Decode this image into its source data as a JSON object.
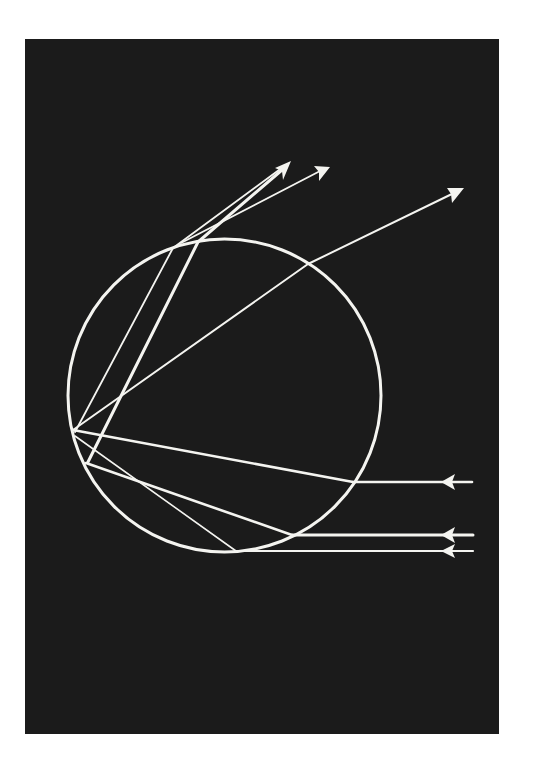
{
  "diagram": {
    "title": "",
    "colors": {
      "page_background": "#ffffff",
      "panel_background": "#1b1b1b",
      "line": "#f4f4f0"
    },
    "panel": {
      "x": 25,
      "y": 39,
      "width": 474,
      "height": 695
    },
    "droplet": {
      "cx": 224.5,
      "cy": 395.5,
      "r": 156.5
    },
    "incoming_rays": [
      {
        "id": "ray-a",
        "y": 482,
        "start_x": 472,
        "entry": [
          353,
          482
        ],
        "arrow_tip": [
          442,
          482
        ]
      },
      {
        "id": "ray-b",
        "y": 535,
        "start_x": 472,
        "entry": [
          292,
          535
        ],
        "arrow_tip": [
          442,
          535
        ]
      },
      {
        "id": "ray-c",
        "y": 551,
        "start_x": 472,
        "entry": [
          236,
          551
        ],
        "arrow_tip": [
          442,
          551
        ]
      }
    ],
    "internal_paths": [
      {
        "id": "ray-a-internal",
        "points": [
          [
            353,
            482
          ],
          [
            73,
            430
          ]
        ]
      },
      {
        "id": "ray-b-internal",
        "points": [
          [
            292,
            535
          ],
          [
            86,
            463
          ]
        ]
      },
      {
        "id": "ray-c-internal",
        "points": [
          [
            236,
            551
          ],
          [
            75,
            436
          ]
        ]
      }
    ],
    "outgoing_rays": [
      {
        "id": "out-1",
        "points": [
          [
            73,
            430
          ],
          [
            308,
            264
          ],
          [
            463,
            189
          ]
        ]
      },
      {
        "id": "out-2",
        "points": [
          [
            75,
            432
          ],
          [
            173,
            248
          ],
          [
            290,
            162
          ]
        ]
      },
      {
        "id": "out-3",
        "points": [
          [
            88,
            462
          ],
          [
            198,
            242
          ],
          [
            329,
            167
          ]
        ]
      }
    ]
  }
}
